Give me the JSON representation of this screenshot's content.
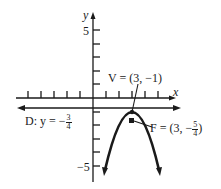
{
  "diagram": {
    "type": "parabola-focus-directrix",
    "axes": {
      "x_label": "x",
      "y_label": "y",
      "y_tick_top_label": "5",
      "y_tick_bottom_label": "−5"
    },
    "vertex": {
      "label_prefix": "V = (3, −1)",
      "x": 3,
      "y": -1
    },
    "focus": {
      "label_prefix": "F = (3, −",
      "frac_num": "5",
      "frac_den": "4",
      "label_suffix": ")",
      "x": 3,
      "y": -1.25
    },
    "directrix": {
      "label_prefix": "D: y = −",
      "frac_num": "3",
      "frac_den": "4",
      "y": -0.75
    },
    "equation_implied": "(x-3)^2 = -(y+1)",
    "colors": {
      "ink": "#1a1a1a",
      "background": "#ffffff"
    }
  }
}
